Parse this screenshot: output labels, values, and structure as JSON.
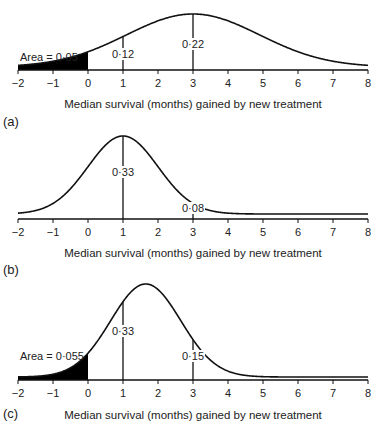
{
  "chart_data": [
    {
      "type": "line",
      "panel_label": "(a)",
      "title": "",
      "xlabel": "Median survival (months) gained by new treatment",
      "ylabel": "",
      "xlim": [
        -2,
        8
      ],
      "xticks": [
        -2,
        -1,
        0,
        1,
        2,
        3,
        4,
        5,
        6,
        7,
        8
      ],
      "xtick_labels": [
        "−2",
        "−1",
        "0",
        "1",
        "2",
        "3",
        "4",
        "5",
        "6",
        "7",
        "8"
      ],
      "distribution": {
        "mean": 3,
        "sd": 1.9,
        "shape": "normal (truncated right tail)"
      },
      "shaded_region": {
        "from": -2,
        "to": 0,
        "label": "Area = 0·05"
      },
      "markers": [
        {
          "x": 1,
          "label": "0·12"
        },
        {
          "x": 3,
          "label": "0·22"
        }
      ]
    },
    {
      "type": "line",
      "panel_label": "(b)",
      "title": "",
      "xlabel": "Median survival (months) gained by new treatment",
      "ylabel": "",
      "xlim": [
        -2,
        8
      ],
      "xticks": [
        -2,
        -1,
        0,
        1,
        2,
        3,
        4,
        5,
        6,
        7,
        8
      ],
      "xtick_labels": [
        "−2",
        "−1",
        "0",
        "1",
        "2",
        "3",
        "4",
        "5",
        "6",
        "7",
        "8"
      ],
      "distribution": {
        "mean": 1,
        "sd": 1.0,
        "shape": "normal"
      },
      "shaded_region": null,
      "markers": [
        {
          "x": 1,
          "label": "0·33"
        },
        {
          "x": 3,
          "label": "0·08"
        }
      ]
    },
    {
      "type": "line",
      "panel_label": "(c)",
      "title": "",
      "xlabel": "Median survival (months) gained by new treatment",
      "ylabel": "",
      "xlim": [
        -2,
        8
      ],
      "xticks": [
        -2,
        -1,
        0,
        1,
        2,
        3,
        4,
        5,
        6,
        7,
        8
      ],
      "xtick_labels": [
        "−2",
        "−1",
        "0",
        "1",
        "2",
        "3",
        "4",
        "5",
        "6",
        "7",
        "8"
      ],
      "distribution": {
        "mean": 1.65,
        "sd": 1.0,
        "shape": "normal"
      },
      "shaded_region": {
        "from": -2,
        "to": 0,
        "label": "Area = 0·055"
      },
      "markers": [
        {
          "x": 1,
          "label": "0·33"
        },
        {
          "x": 3,
          "label": "0·15"
        }
      ]
    }
  ]
}
